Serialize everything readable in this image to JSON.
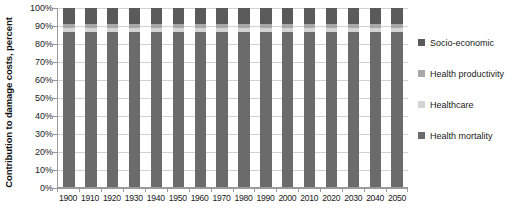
{
  "chart_data": {
    "type": "bar",
    "subtype": "stacked-100-percent-column",
    "title": "",
    "xlabel": "",
    "ylabel": "Contribution to damage costs, percent",
    "ylim": [
      0,
      100
    ],
    "y_tick_labels": [
      "100%",
      "90%",
      "80%",
      "70%",
      "60%",
      "50%",
      "40%",
      "30%",
      "20%",
      "10%",
      "0%"
    ],
    "y_tick_values": [
      100,
      90,
      80,
      70,
      60,
      50,
      40,
      30,
      20,
      10,
      0
    ],
    "grid": true,
    "legend_position": "right",
    "categories": [
      "1900",
      "1910",
      "1920",
      "1930",
      "1940",
      "1950",
      "1960",
      "1970",
      "1980",
      "1990",
      "2000",
      "2010",
      "2020",
      "2030",
      "2040",
      "2050"
    ],
    "series": [
      {
        "name": "Health mortality",
        "color": "#6b6b6b",
        "values": [
          86.5,
          86.5,
          86.5,
          86.5,
          86.5,
          86.5,
          86.5,
          86.5,
          86.5,
          86.5,
          86.5,
          86.5,
          86.5,
          86.5,
          86.5,
          86.5
        ]
      },
      {
        "name": "Healthcare",
        "color": "#d4d4d4",
        "values": [
          2.5,
          2.5,
          2.5,
          2.5,
          2.5,
          2.5,
          2.5,
          2.5,
          2.5,
          2.5,
          2.5,
          2.5,
          2.5,
          2.5,
          2.5,
          2.5
        ]
      },
      {
        "name": "Health productivity",
        "color": "#a8a8a8",
        "values": [
          2.0,
          2.0,
          2.0,
          2.0,
          2.0,
          2.0,
          2.0,
          2.0,
          2.0,
          2.0,
          2.0,
          2.0,
          2.0,
          2.0,
          2.0,
          2.0
        ]
      },
      {
        "name": "Socio-economic",
        "color": "#5a5a5a",
        "values": [
          9.0,
          9.0,
          9.0,
          9.0,
          9.0,
          9.0,
          9.0,
          9.0,
          9.0,
          9.0,
          9.0,
          9.0,
          9.0,
          9.0,
          9.0,
          9.0
        ]
      }
    ],
    "legend": [
      {
        "label": "Socio-economic",
        "color": "#5a5a5a"
      },
      {
        "label": "Health productivity",
        "color": "#a8a8a8"
      },
      {
        "label": "Healthcare",
        "color": "#d4d4d4"
      },
      {
        "label": "Health mortality",
        "color": "#6b6b6b"
      }
    ]
  }
}
